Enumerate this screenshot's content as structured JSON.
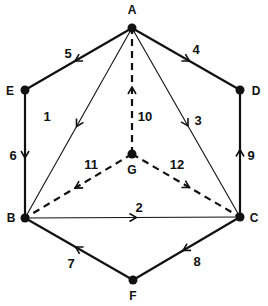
{
  "nodes": [
    {
      "id": "A",
      "label": "A",
      "x": 132,
      "y": 28,
      "lx": 132,
      "ly": 14
    },
    {
      "id": "B",
      "label": "B",
      "x": 25,
      "y": 218,
      "lx": 11,
      "ly": 222
    },
    {
      "id": "C",
      "label": "C",
      "x": 240,
      "y": 217,
      "lx": 254,
      "ly": 222
    },
    {
      "id": "D",
      "label": "D",
      "x": 240,
      "y": 90,
      "lx": 256,
      "ly": 95
    },
    {
      "id": "E",
      "label": "E",
      "x": 25,
      "y": 90,
      "lx": 10,
      "ly": 95
    },
    {
      "id": "F",
      "label": "F",
      "x": 133,
      "y": 280,
      "lx": 133,
      "ly": 300
    },
    {
      "id": "G",
      "label": "G",
      "x": 132,
      "y": 154,
      "lx": 132,
      "ly": 174
    }
  ],
  "edges": [
    {
      "label": "1",
      "from": "A",
      "to": "B",
      "style": "thin",
      "lx": 47,
      "ly": 121
    },
    {
      "label": "2",
      "from": "B",
      "to": "C",
      "style": "thin",
      "lx": 139,
      "ly": 212
    },
    {
      "label": "3",
      "from": "A",
      "to": "C",
      "style": "thin",
      "lx": 198,
      "ly": 125
    },
    {
      "label": "4",
      "from": "A",
      "to": "D",
      "style": "thick",
      "lx": 196,
      "ly": 54
    },
    {
      "label": "5",
      "from": "A",
      "to": "E",
      "style": "thick",
      "lx": 68,
      "ly": 58
    },
    {
      "label": "6",
      "from": "E",
      "to": "B",
      "style": "thick",
      "lx": 13,
      "ly": 160
    },
    {
      "label": "7",
      "from": "F",
      "to": "B",
      "style": "thick",
      "lx": 71,
      "ly": 268
    },
    {
      "label": "8",
      "from": "C",
      "to": "F",
      "style": "thick",
      "lx": 197,
      "ly": 266
    },
    {
      "label": "9",
      "from": "C",
      "to": "D",
      "style": "thick",
      "lx": 251,
      "ly": 160
    },
    {
      "label": "10",
      "from": "G",
      "to": "A",
      "style": "dashed",
      "lx": 145,
      "ly": 121
    },
    {
      "label": "11",
      "from": "G",
      "to": "B",
      "style": "dashed",
      "lx": 91,
      "ly": 169
    },
    {
      "label": "12",
      "from": "G",
      "to": "C",
      "style": "dashed",
      "lx": 177,
      "ly": 169
    }
  ],
  "colors": {
    "line": "#111111",
    "background": "#ffffff"
  }
}
